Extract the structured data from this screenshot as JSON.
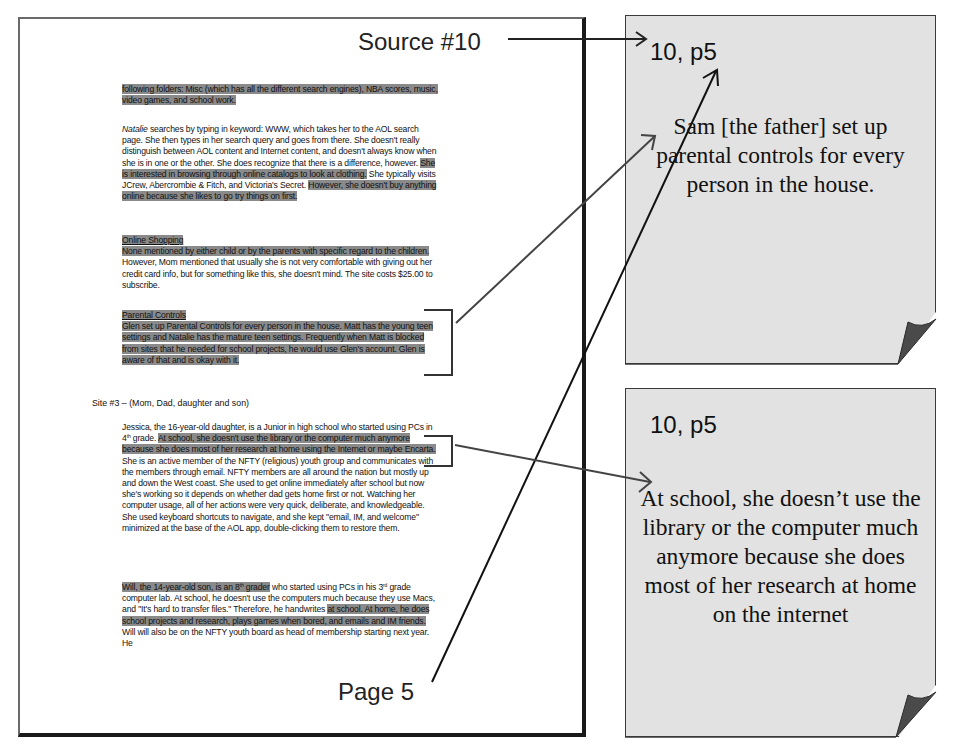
{
  "labels": {
    "source": "Source #10",
    "page": "Page 5"
  },
  "document": {
    "para1": {
      "highlighted": "following folders: Misc (which has all the different search engines), NBA scores, music, video games, and school work."
    },
    "para2": {
      "name": "Natalie",
      "text1": " searches by typing in keyword: WWW, which takes her to the AOL search page. She then types in her search query and goes from there. She doesn't really distinguish between AOL content and Internet content, and doesn't always know when she is in one or the other. She does recognize that there is a difference, however. ",
      "hl1": "She is interested in browsing through online catalogs to look at clothing.",
      "text2": " She typically visits JCrew, Abercrombie & Fitch, and Victoria's Secret. ",
      "hl2": "However, she doesn't buy anything online because she likes to go try things on first."
    },
    "online_shopping": {
      "heading": "Online Shopping",
      "hl": "None mentioned by either child or by the parents with specific regard to the children.",
      "text": " However, Mom mentioned that usually she is not very comfortable with giving out her credit card info, but for something like this, she doesn't mind.  The site costs $25.00 to subscribe."
    },
    "parental_controls": {
      "heading": "Parental Controls",
      "hl": "Glen set up Parental Controls for every person in the house. Matt has the young teen settings and Natalie has the mature teen settings.  Frequently when Matt is blocked from sites that he needed for school projects, he would use Glen's account.  Glen is aware of that and is okay with it."
    },
    "site_heading": "Site #3 – (Mom, Dad, daughter and son)",
    "jessica": {
      "text1": "Jessica, the 16-year-old daughter, is a Junior in high school who started using PCs in 4",
      "sup1": "th",
      "text2": " grade. ",
      "hl": "At school, she doesn't use the library or the computer much anymore because she does most of her research at home using the Internet or maybe Encarta.",
      "text3": " She is an active member of the NFTY (religious) youth group and communicates with the members through email. NFTY members are all around the nation but mostly up and down the West coast.  She used to get online immediately after school but now she's working so it depends on whether dad gets home first or not.  Watching her computer usage, all of her actions were very quick, deliberate, and knowledgeable. She used keyboard shortcuts to navigate, and she kept \"email, IM, and welcome\" minimized at the base of the AOL app, double-clicking them to restore them."
    },
    "will": {
      "hl1": "Will, the 14-year-old son, is an 8",
      "sup1": "th",
      "hl1b": " grader",
      "text1": " who started using PCs in his 3",
      "sup2": "rd",
      "text2": " grade computer lab. At school, he doesn't use the computers much because they use Macs, and \"It's hard to transfer files.\" Therefore, he handwrites ",
      "hl2": "at school. At home, he does school projects and research, plays games when bored, and emails and IM friends.",
      "text3": "  Will will also be on the NFTY youth board as head of membership starting next year. He"
    }
  },
  "notes": [
    {
      "ref": "10, p5",
      "body": "Sam [the father] set up parental controls for every person in the house."
    },
    {
      "ref": "10, p5",
      "body": "At school, she doesn’t use the library or the computer much anymore because she does most of her research at home on the internet"
    }
  ],
  "colors": {
    "highlight": "#8a8a8a",
    "note_fill": "#e2e2e2",
    "note_fold": "#4a4a4a",
    "arrow": "#333333"
  }
}
